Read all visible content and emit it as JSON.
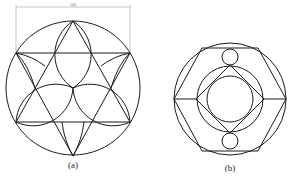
{
  "figures": [
    {
      "id": "a",
      "label": "(a)",
      "dimension": {
        "value": "100"
      },
      "description": "Circle with inscribed hexagram (two overlapping triangles) and lens-shaped arcs"
    },
    {
      "id": "b",
      "label": "(b)",
      "description": "Circle with inscribed hexagon, inner concentric circles, rhombus and two small tangent circles"
    }
  ],
  "colors": {
    "line": "#1a1a1a",
    "dimension": "#8a8a8a",
    "background": "#ffffff"
  }
}
